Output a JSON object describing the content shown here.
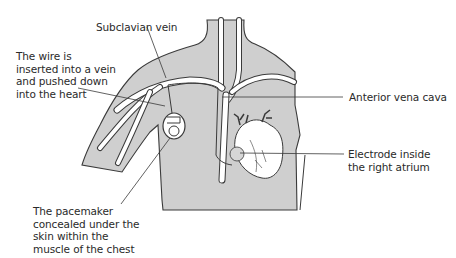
{
  "diagram": {
    "colors": {
      "body_fill": "#cfcfcf",
      "outline": "#3a3a3a",
      "vein_fill": "#ffffff",
      "background": "#ffffff",
      "text": "#2a2a2a"
    },
    "labels": {
      "subclavian_vein": "Subclavian vein",
      "wire_inserted": "The wire is\ninserted into a vein\nand pushed down\ninto the heart",
      "anterior_vena_cava": "Anterior vena cava",
      "electrode": "Electrode inside\nthe right atrium",
      "pacemaker": "The pacemaker\nconcealed under the\nskin within the\nmuscle of the chest"
    },
    "icons": {
      "heart": "heart-icon",
      "pacemaker_device": "pacemaker-device-icon"
    }
  }
}
